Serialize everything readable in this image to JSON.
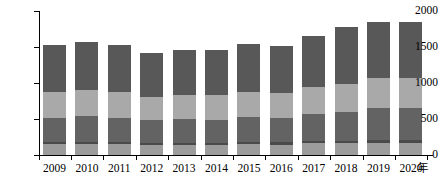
{
  "axes": {
    "y_ticks": [
      0,
      500,
      1000,
      1500,
      2000
    ],
    "y_max": 2000,
    "y_min": 0,
    "x_unit_label": "年"
  },
  "colors": {
    "seg_base": "#9c9c9c",
    "seg_band": "#4a4a4a",
    "seg_mid_dark": "#636363",
    "seg_mid_light": "#a9a9a9",
    "seg_top": "#585858",
    "axis": "#000000",
    "background": "#ffffff"
  },
  "chart_data": {
    "type": "bar",
    "title": "",
    "xlabel": "年",
    "ylabel": "",
    "ylim": [
      0,
      2000
    ],
    "grid": false,
    "legend": "none",
    "stacked": true,
    "categories": [
      "2009",
      "2010",
      "2011",
      "2012",
      "2013",
      "2014",
      "2015",
      "2016",
      "2017",
      "2018",
      "2019",
      "2020"
    ],
    "series": [
      {
        "name": "seg_base",
        "values": [
          150,
          155,
          150,
          135,
          140,
          140,
          150,
          145,
          160,
          165,
          170,
          170
        ]
      },
      {
        "name": "seg_band",
        "values": [
          30,
          30,
          30,
          25,
          25,
          25,
          30,
          30,
          35,
          35,
          40,
          40
        ]
      },
      {
        "name": "seg_mid_dark",
        "values": [
          340,
          355,
          340,
          320,
          330,
          325,
          345,
          335,
          380,
          400,
          440,
          440
        ]
      },
      {
        "name": "seg_mid_light",
        "values": [
          360,
          370,
          360,
          330,
          340,
          340,
          355,
          350,
          375,
          390,
          415,
          415
        ]
      },
      {
        "name": "seg_top",
        "values": [
          650,
          660,
          650,
          610,
          625,
          625,
          665,
          655,
          700,
          790,
          785,
          785
        ]
      }
    ],
    "totals": [
      1530,
      1570,
      1530,
      1420,
      1460,
      1455,
      1545,
      1515,
      1650,
      1780,
      1850,
      1850
    ]
  }
}
